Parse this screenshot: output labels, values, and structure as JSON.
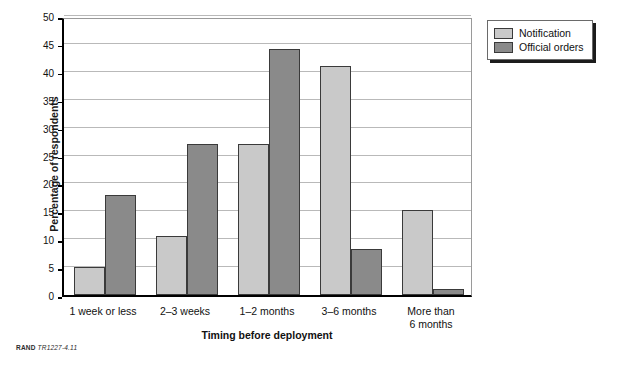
{
  "chart_data": {
    "type": "bar",
    "title": "",
    "xlabel": "Timing before deployment",
    "ylabel": "Percentage of respondents",
    "ylim": [
      0,
      50
    ],
    "ytick_step": 5,
    "yticks": [
      0,
      5,
      10,
      15,
      20,
      25,
      30,
      35,
      40,
      45,
      50
    ],
    "grid": "horizontal",
    "legend_position": "top-right-outside",
    "categories": [
      "1 week or less",
      "2–3 weeks",
      "1–2 months",
      "3–6 months",
      "More than\n6 months"
    ],
    "series": [
      {
        "name": "Notification",
        "color": "#c9c9c9",
        "values": [
          5.0,
          10.5,
          27.0,
          41.0,
          15.2
        ]
      },
      {
        "name": "Official orders",
        "color": "#8a8a8a",
        "values": [
          18.0,
          27.0,
          44.0,
          8.2,
          1.0
        ]
      }
    ]
  },
  "legend": {
    "items": [
      {
        "label": "Notification",
        "color": "#c9c9c9"
      },
      {
        "label": "Official orders",
        "color": "#8a8a8a"
      }
    ]
  },
  "footnote": {
    "mark": "RAND",
    "id": "TR1227-4.11"
  },
  "colors": {
    "notification": "#c9c9c9",
    "official_orders": "#8a8a8a",
    "bar_edge": "#3a3a3a",
    "gridline": "#b9b9b9",
    "axis": "#000000"
  }
}
